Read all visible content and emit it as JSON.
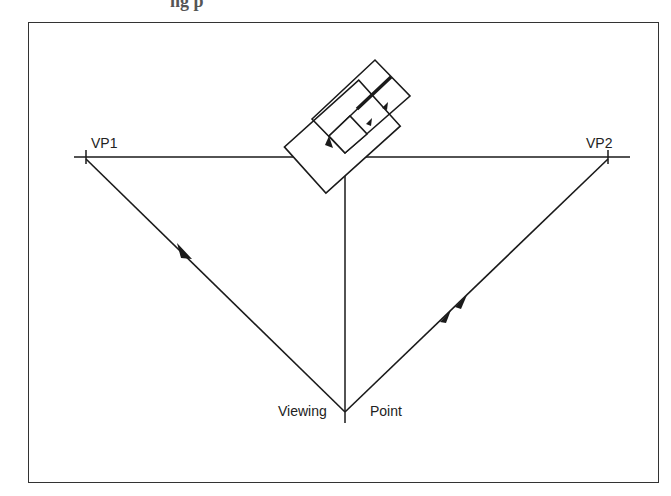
{
  "diagram": {
    "type": "perspective-two-point",
    "top_cut_text": "ng p",
    "labels": {
      "vp1": "VP1",
      "vp2": "VP2",
      "viewing": "Viewing",
      "point": "Point"
    },
    "points": {
      "vp1": [
        86,
        157
      ],
      "vp2": [
        608,
        157
      ],
      "viewing_point": [
        345,
        412
      ],
      "horizon": [
        [
          74,
          157
        ],
        [
          630,
          157
        ]
      ],
      "vertical": [
        [
          345,
          157
        ],
        [
          345,
          423
        ]
      ]
    },
    "colors": {
      "line": "#1a1a1a",
      "frame": "#333333",
      "background": "#ffffff"
    }
  }
}
